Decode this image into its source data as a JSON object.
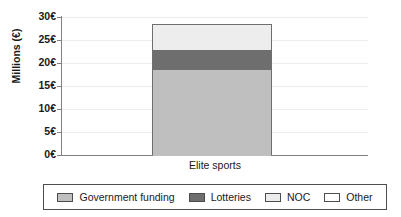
{
  "chart_data": {
    "type": "bar",
    "stacked": true,
    "title": "",
    "xlabel": "",
    "ylabel": "Millions (€)",
    "categories": [
      "Elite sports"
    ],
    "series": [
      {
        "name": "Government funding",
        "values": [
          19.0
        ],
        "color": "#bfbfbf"
      },
      {
        "name": "Lotteries",
        "values": [
          4.0
        ],
        "color": "#6e6e6e"
      },
      {
        "name": "NOC",
        "values": [
          5.5
        ],
        "color": "#ededed"
      },
      {
        "name": "Other",
        "values": [
          0.0
        ],
        "color": "#ffffff"
      }
    ],
    "total": 28.5,
    "ylim": [
      0,
      30
    ],
    "yticks": [
      0,
      5,
      10,
      15,
      20,
      25,
      30
    ],
    "ytick_labels": [
      "0€",
      "5€",
      "10€",
      "15€",
      "20€",
      "25€",
      "30€"
    ],
    "grid": true,
    "grid_axis": "y",
    "legend_position": "bottom",
    "legend_entries": [
      "Government funding",
      "Lotteries",
      "NOC",
      "Other"
    ]
  },
  "axis": {
    "y_title": "Millions (€)",
    "x_category": "Elite sports"
  },
  "colors": {
    "axis_line": "#808080",
    "grid_line": "#ececed",
    "bar_outline": "#6e6e6e",
    "legend_border": "#4d4d4d",
    "text": "#1a1a1a",
    "background": "#ffffff"
  }
}
